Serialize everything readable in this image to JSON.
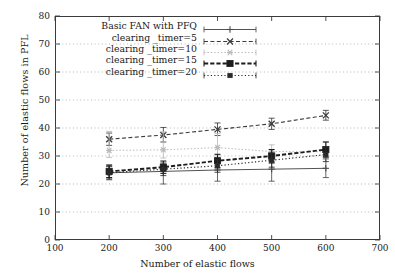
{
  "chart_data": {
    "type": "line",
    "title": "",
    "xlabel": "Number of elastic flows",
    "ylabel": "Number of elastic flows in PFL",
    "xlim": [
      100,
      700
    ],
    "ylim": [
      0,
      80
    ],
    "xticks": [
      100,
      200,
      300,
      400,
      500,
      600,
      700
    ],
    "yticks": [
      0,
      10,
      20,
      30,
      40,
      50,
      60,
      70,
      80
    ],
    "grid": "horizontal-dotted",
    "legend_position": "top-left-inside",
    "x": [
      200,
      300,
      400,
      500,
      600
    ],
    "series": [
      {
        "name": "Basic FAN with PFQ",
        "values": [
          24.0,
          24.5,
          25.0,
          25.3,
          25.6
        ],
        "yerr_low": [
          21.5,
          20.0,
          21.0,
          21.0,
          22.3
        ],
        "yerr_high": [
          26.5,
          27.0,
          27.5,
          28.0,
          29.0
        ],
        "marker": "plus",
        "line_style": "solid",
        "color": "#4a4a4a"
      },
      {
        "name": "clearing _timer=5",
        "values": [
          36.0,
          37.5,
          39.5,
          41.5,
          44.5
        ],
        "yerr_low": [
          33.8,
          35.0,
          37.3,
          39.5,
          42.8
        ],
        "yerr_high": [
          38.2,
          40.2,
          41.8,
          43.5,
          46.3
        ],
        "marker": "cross",
        "line_style": "dashed",
        "color": "#3a3a3a"
      },
      {
        "name": "clearing _timer=10",
        "values": [
          32.0,
          32.2,
          33.0,
          31.6,
          31.5
        ],
        "yerr_low": [
          29.5,
          29.3,
          30.0,
          29.0,
          28.8
        ],
        "yerr_high": [
          38.8,
          38.6,
          38.0,
          34.0,
          35.0
        ],
        "marker": "star",
        "line_style": "dotted",
        "color": "#b9b9b9"
      },
      {
        "name": "clearing _timer=15",
        "values": [
          24.5,
          26.0,
          28.3,
          30.0,
          32.3
        ],
        "yerr_low": [
          22.3,
          23.8,
          25.8,
          27.5,
          29.6
        ],
        "yerr_high": [
          26.8,
          28.2,
          30.6,
          32.3,
          35.0
        ],
        "marker": "filled-square",
        "line_style": "dashed-bold",
        "color": "#1d1d1d"
      },
      {
        "name": "clearing _timer=20",
        "values": [
          24.0,
          25.3,
          26.5,
          28.5,
          30.5
        ],
        "yerr_low": [
          21.8,
          23.0,
          24.2,
          26.0,
          28.0
        ],
        "yerr_high": [
          26.2,
          27.5,
          28.8,
          31.0,
          33.0
        ],
        "marker": "small-filled-square",
        "line_style": "fine-dotted",
        "color": "#2a2a2a"
      }
    ]
  },
  "axes": {
    "y_title": "Number of elastic flows in PFL",
    "x_title": "Number of elastic flows",
    "y_tick_labels": [
      "0",
      "10",
      "20",
      "30",
      "40",
      "50",
      "60",
      "70",
      "80"
    ],
    "x_tick_labels": [
      "100",
      "200",
      "300",
      "400",
      "500",
      "600",
      "700"
    ]
  },
  "legend": {
    "entries": [
      {
        "label": "Basic FAN with PFQ"
      },
      {
        "label": "clearing _timer=5"
      },
      {
        "label": "clearing _timer=10"
      },
      {
        "label": "clearing _timer=15"
      },
      {
        "label": "clearing _timer=20"
      }
    ]
  }
}
